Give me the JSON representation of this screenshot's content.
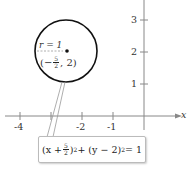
{
  "figure": {
    "type": "circle-graph",
    "x_axis": {
      "label": "x",
      "ticks": [
        "-4",
        "-2",
        "-1"
      ]
    },
    "y_axis": {
      "ticks": [
        "1",
        "2",
        "3"
      ]
    },
    "circle": {
      "center_label_prefix": "(−",
      "center_num": "5",
      "center_den": "2",
      "center_label_suffix": ", 2)",
      "radius_label": "r = 1"
    },
    "equation": {
      "part1": "(x + ",
      "num": "5",
      "den": "2",
      "part2": ")",
      "exp1": "2",
      "part3": " + (y − 2)",
      "exp2": "2",
      "part4": " = 1"
    }
  }
}
